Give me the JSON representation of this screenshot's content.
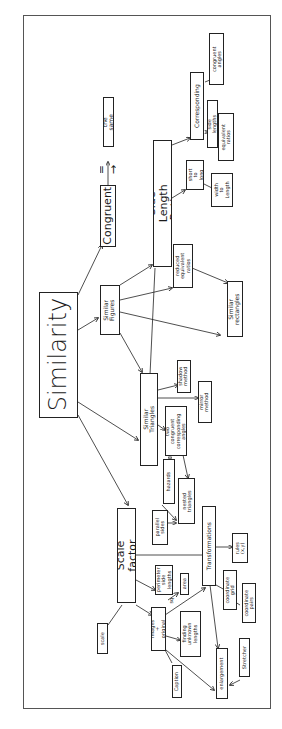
{
  "diagram": {
    "title": "Similarity",
    "orientation": "rotated 90 degrees counter-clockwise (text reads bottom-to-top)",
    "nodes": {
      "similarity": "Similarity",
      "congruent": "Congruent",
      "congruent_equals": "= →",
      "the_same": "the same",
      "similar_figures": "Similar\nFigures",
      "side_length_ratios": "Side Length Ratios",
      "corresponding": "Corresponding",
      "congruent_angles": "congruent\nangles",
      "side_lengths": "side lengths",
      "equivalent_ratios": "equivalent\nratios",
      "short_to_long": "short\nto\nlong",
      "width_to_length": "width\nto\nLength",
      "reduced_equivalent_ratios": "reduced\nequivalent\nratios",
      "similar_rectangles": "Similar\nrectangles",
      "similar_triangles": "Similar Triangles",
      "shadow_method": "shadow\nmethod",
      "mirror_method": "mirror\nmethod",
      "two_congruent_corresponding_angles": "two\ncongruent\ncorresponding\nangles",
      "hazards": "hazards",
      "nested_triangles": "nested\ntriangles",
      "parallel_sides": "parallel\nsides",
      "scale_factor": "Scale factor",
      "perimeter_side_lengths": "perimeter\nside\nlengths",
      "area": "area",
      "transformations": "Transformations",
      "rules_xy": "rules\n(x,y)",
      "coordinate_grid": "coordinate\ngrid",
      "coordinate_pairs": "coordinate\npairs",
      "images_original": "images +\noriginal",
      "finding_unknown_lengths": "finding\nunknown\nlengths",
      "scale": "scale",
      "caption": "Caption",
      "enlargement": "enlargement",
      "stretcher": "Stretcher",
      "edge_label_sq": "sq"
    },
    "edges": [
      [
        "similarity",
        "congruent"
      ],
      [
        "congruent",
        "the_same"
      ],
      [
        "similarity",
        "similar_figures"
      ],
      [
        "similarity",
        "similar_triangles"
      ],
      [
        "similarity",
        "scale_factor"
      ],
      [
        "similar_figures",
        "side_length_ratios"
      ],
      [
        "similar_figures",
        "reduced_equivalent_ratios"
      ],
      [
        "similar_figures",
        "similar_rectangles"
      ],
      [
        "similar_figures",
        "similar_triangles"
      ],
      [
        "side_length_ratios",
        "corresponding"
      ],
      [
        "side_length_ratios",
        "short_to_long"
      ],
      [
        "side_length_ratios",
        "reduced_equivalent_ratios"
      ],
      [
        "corresponding",
        "congruent_angles"
      ],
      [
        "corresponding",
        "side_lengths"
      ],
      [
        "short_to_long",
        "width_to_length"
      ],
      [
        "reduced_equivalent_ratios",
        "similar_rectangles"
      ],
      [
        "similar_triangles",
        "shadow_method"
      ],
      [
        "similar_triangles",
        "mirror_method"
      ],
      [
        "similar_triangles",
        "two_congruent_corresponding_angles"
      ],
      [
        "similar_triangles",
        "hazards"
      ],
      [
        "two_congruent_corresponding_angles",
        "nested_triangles"
      ],
      [
        "hazards",
        "nested_triangles"
      ],
      [
        "parallel_sides",
        "nested_triangles"
      ],
      [
        "scale_factor",
        "transformations"
      ],
      [
        "scale_factor",
        "perimeter_side_lengths"
      ],
      [
        "scale_factor",
        "images_original"
      ],
      [
        "scale_factor",
        "scale"
      ],
      [
        "transformations",
        "rules_xy"
      ],
      [
        "transformations",
        "coordinate_grid"
      ],
      [
        "transformations",
        "enlargement"
      ],
      [
        "coordinate_grid",
        "coordinate_pairs"
      ],
      [
        "images_original",
        "transformations"
      ],
      [
        "images_original",
        "finding_unknown_lengths"
      ],
      [
        "images_original",
        "area"
      ],
      [
        "images_original",
        "caption"
      ],
      [
        "images_original",
        "enlargement"
      ],
      [
        "stretcher",
        "enlargement"
      ]
    ]
  }
}
